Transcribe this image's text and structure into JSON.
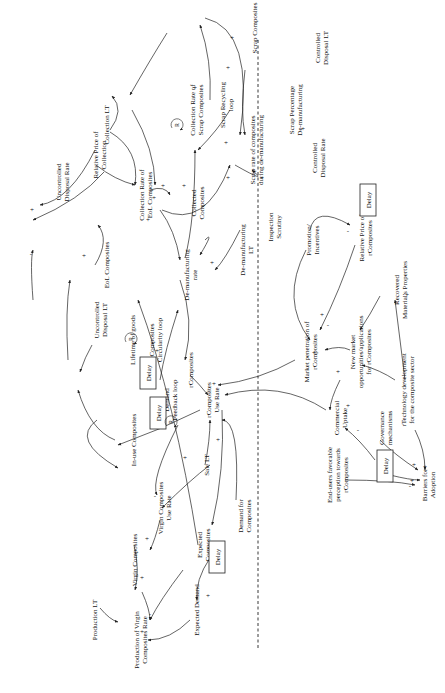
{
  "diagram": {
    "type": "causal-loop-diagram",
    "orientation": "rotated-90-ccw",
    "colors": {
      "line": "#222222",
      "text": "#111111",
      "background": "#ffffff"
    },
    "nodes": [
      {
        "id": "uncontrolled_disposal_rate",
        "label": [
          "Uncontrolled",
          "Disposal Rate"
        ],
        "x": 62,
        "y": 182
      },
      {
        "id": "relative_price_collection",
        "label": [
          "Relative Price of",
          "Collection"
        ],
        "x": 99,
        "y": 155
      },
      {
        "id": "collection_lt",
        "label": [
          "Collection LT"
        ],
        "x": 106,
        "y": 125
      },
      {
        "id": "collection_rate_eol",
        "label": [
          "Collection Rate of",
          "EoL Composites"
        ],
        "x": 145,
        "y": 195
      },
      {
        "id": "collection_rate_scrap",
        "label": [
          "Collection Rate of",
          "Scrap Composites"
        ],
        "x": 196,
        "y": 110
      },
      {
        "id": "scrap_recycling_loop",
        "label": [
          "Scrap Recycling",
          "loop"
        ],
        "x": 226,
        "y": 105
      },
      {
        "id": "collected_composites",
        "label": [
          "Collected",
          "Composites"
        ],
        "x": 197,
        "y": 203
      },
      {
        "id": "scrap_rate_demanufacturing",
        "label": [
          "Scrap rate of composites",
          "during de-manufacturing"
        ],
        "x": 256,
        "y": 150
      },
      {
        "id": "scrap_composites",
        "label": [
          "Scrap Composites"
        ],
        "x": 254,
        "y": 28
      },
      {
        "id": "scrap_percentage",
        "label": [
          "Scrap Percentage",
          "De-manufacturing"
        ],
        "x": 295,
        "y": 110
      },
      {
        "id": "controlled_disposal_lt",
        "label": [
          "Controlled",
          "Disposal LT"
        ],
        "x": 321,
        "y": 48
      },
      {
        "id": "controlled_disposal_rate",
        "label": [
          "Controlled",
          "Disposal Rate"
        ],
        "x": 318,
        "y": 158
      },
      {
        "id": "demanufacturing_lt",
        "label": [
          "De-manufacturing",
          "LT"
        ],
        "x": 246,
        "y": 250
      },
      {
        "id": "inspection_scrutiny",
        "label": [
          "Inspection",
          "Scrutiny"
        ],
        "x": 274,
        "y": 227
      },
      {
        "id": "demanufacturing_rate",
        "label": [
          "De-manufacturing",
          "rate"
        ],
        "x": 190,
        "y": 275
      },
      {
        "id": "uncontrolled_disposal_lt",
        "label": [
          "Uncontrolled",
          "Disposal LT"
        ],
        "x": 100,
        "y": 320
      },
      {
        "id": "eol_composites",
        "label": [
          "EoL Composites"
        ],
        "x": 106,
        "y": 265
      },
      {
        "id": "lifetime_goods",
        "label": [
          "Lifetime of goods"
        ],
        "x": 132,
        "y": 340
      },
      {
        "id": "rcomposites",
        "label": [
          "rComposites"
        ],
        "x": 190,
        "y": 370
      },
      {
        "id": "composites_circularity_loop",
        "label": [
          "Composites",
          "Circularity loop"
        ],
        "x": 155,
        "y": 340
      },
      {
        "id": "demand_feedback_loop",
        "label": [
          "Demand",
          "Feedback loop"
        ],
        "x": 170,
        "y": 400
      },
      {
        "id": "rcomposites_use_rate",
        "label": [
          "rComposites",
          "Use Rate"
        ],
        "x": 212,
        "y": 400
      },
      {
        "id": "inuse_composites",
        "label": [
          "In-use Composites"
        ],
        "x": 133,
        "y": 440
      },
      {
        "id": "sale_lt",
        "label": [
          "Sale LT"
        ],
        "x": 206,
        "y": 465
      },
      {
        "id": "virgin_composites_use_rate",
        "label": [
          "Virgin Composites",
          "Use Rate"
        ],
        "x": 164,
        "y": 508
      },
      {
        "id": "virgin_composites",
        "label": [
          "Virgin Composites"
        ],
        "x": 134,
        "y": 560
      },
      {
        "id": "expected_composites",
        "label": [
          "Expected",
          "Composites"
        ],
        "x": 203,
        "y": 545
      },
      {
        "id": "demand_for_composites",
        "label": [
          "Demand for",
          "Composites"
        ],
        "x": 244,
        "y": 516
      },
      {
        "id": "expected_demand",
        "label": [
          "Expected Demand"
        ],
        "x": 196,
        "y": 610
      },
      {
        "id": "production_lt",
        "label": [
          "Production LT"
        ],
        "x": 94,
        "y": 620
      },
      {
        "id": "production_virgin_rate",
        "label": [
          "Production of Virgin",
          "Composites Rate"
        ],
        "x": 140,
        "y": 640
      },
      {
        "id": "promotion_incentives",
        "label": [
          "Promotion/",
          "Incentives"
        ],
        "x": 312,
        "y": 240
      },
      {
        "id": "relative_price_rcomposites",
        "label": [
          "Relative Price of",
          "rComposites"
        ],
        "x": 365,
        "y": 238
      },
      {
        "id": "recovered_material_properties",
        "label": [
          "Recovered",
          "Material's Properties"
        ],
        "x": 400,
        "y": 290
      },
      {
        "id": "market_penetration",
        "label": [
          "Market penetration of",
          "rComposites"
        ],
        "x": 310,
        "y": 352
      },
      {
        "id": "new_market_opportunities",
        "label": [
          "New market",
          "opportunities/applications",
          "for rComposites"
        ],
        "x": 360,
        "y": 352
      },
      {
        "id": "commercial_uptake",
        "label": [
          "Commercial",
          "Uptake"
        ],
        "x": 340,
        "y": 418
      },
      {
        "id": "governance_mechanisms",
        "label": [
          "Governance",
          "mechanisms"
        ],
        "x": 385,
        "y": 428
      },
      {
        "id": "technology_development",
        "label": [
          "rTechnology development",
          "for the composite sector"
        ],
        "x": 407,
        "y": 390
      },
      {
        "id": "endusers_perception",
        "label": [
          "End-users favorable",
          "perception towards",
          "rComposites"
        ],
        "x": 337,
        "y": 475
      },
      {
        "id": "barriers_adoption",
        "label": [
          "Barriers for",
          "Adoption"
        ],
        "x": 428,
        "y": 485
      }
    ],
    "delays": [
      {
        "id": "delay_top_right",
        "label": "Delay",
        "x": 368,
        "y": 200
      },
      {
        "id": "delay_eol",
        "label": "Delay",
        "x": 148,
        "y": 373
      },
      {
        "id": "delay_circularity",
        "label": "Delay",
        "x": 158,
        "y": 413
      },
      {
        "id": "delay_expected",
        "label": "Delay",
        "x": 217,
        "y": 557
      },
      {
        "id": "delay_barriers",
        "label": "Delay",
        "x": 385,
        "y": 466
      }
    ],
    "loops": [
      {
        "id": "loop_scrap",
        "letter": "R",
        "x": 177,
        "y": 125
      },
      {
        "id": "loop_circularity",
        "letter": "R",
        "x": 131,
        "y": 339
      },
      {
        "id": "loop_demand",
        "letter": "R",
        "x": 171,
        "y": 422
      }
    ],
    "signs": [
      {
        "t": "+",
        "x": 32,
        "y": 212
      },
      {
        "t": "+",
        "x": 84,
        "y": 258
      },
      {
        "t": "+",
        "x": 148,
        "y": 222
      },
      {
        "t": "+",
        "x": 163,
        "y": 188
      },
      {
        "t": "+",
        "x": 154,
        "y": 200
      },
      {
        "t": "+",
        "x": 184,
        "y": 188
      },
      {
        "t": "+",
        "x": 195,
        "y": 90
      },
      {
        "t": "+",
        "x": 226,
        "y": 145
      },
      {
        "t": "+",
        "x": 228,
        "y": 180
      },
      {
        "t": "+",
        "x": 228,
        "y": 70
      },
      {
        "t": "+",
        "x": 232,
        "y": 40
      },
      {
        "t": "+",
        "x": 262,
        "y": 180
      },
      {
        "t": "+",
        "x": 303,
        "y": 131
      },
      {
        "t": "+",
        "x": 212,
        "y": 265
      },
      {
        "t": "+",
        "x": 157,
        "y": 353
      },
      {
        "t": "+",
        "x": 214,
        "y": 386
      },
      {
        "t": "+",
        "x": 185,
        "y": 460
      },
      {
        "t": "+",
        "x": 218,
        "y": 442
      },
      {
        "t": "+",
        "x": 147,
        "y": 541
      },
      {
        "t": "+",
        "x": 208,
        "y": 598
      },
      {
        "t": "+",
        "x": 142,
        "y": 580
      },
      {
        "t": "+",
        "x": 142,
        "y": 634
      },
      {
        "t": "+",
        "x": 322,
        "y": 317
      },
      {
        "t": "+",
        "x": 314,
        "y": 355
      },
      {
        "t": "+",
        "x": 407,
        "y": 297
      },
      {
        "t": "+",
        "x": 338,
        "y": 374
      },
      {
        "t": "+",
        "x": 348,
        "y": 408
      },
      {
        "t": "+",
        "x": 425,
        "y": 469
      },
      {
        "t": "+",
        "x": 414,
        "y": 467
      },
      {
        "t": "+",
        "x": 412,
        "y": 483
      },
      {
        "t": "-",
        "x": 31,
        "y": 256
      },
      {
        "t": "-",
        "x": 210,
        "y": 408
      },
      {
        "t": "-",
        "x": 209,
        "y": 393
      },
      {
        "t": "-",
        "x": 328,
        "y": 327
      },
      {
        "t": "-",
        "x": 348,
        "y": 233
      },
      {
        "t": "-",
        "x": 410,
        "y": 488
      },
      {
        "t": "-",
        "x": 358,
        "y": 432
      },
      {
        "t": "-",
        "x": 155,
        "y": 498
      },
      {
        "t": "-",
        "x": 150,
        "y": 616
      }
    ],
    "divider": {
      "x": 258,
      "y1": 40,
      "y2": 645,
      "style": "dashed"
    }
  }
}
